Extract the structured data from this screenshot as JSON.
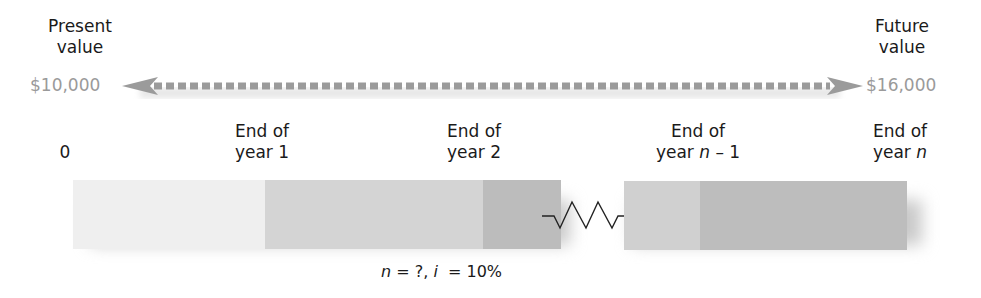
{
  "left": {
    "label_line1": "Present",
    "label_line2": "value",
    "amount": "$10,000"
  },
  "right": {
    "label_line1": "Future",
    "label_line2": "value",
    "amount": "$16,000"
  },
  "ticks": [
    {
      "line1": "",
      "line2": "0"
    },
    {
      "line1": "End of",
      "line2": "year 1"
    },
    {
      "line1": "End of",
      "line2": "year 2"
    },
    {
      "line1": "End of",
      "line2_prefix": "year ",
      "line2_var": "n",
      "line2_suffix": " – 1"
    },
    {
      "line1": "End of",
      "line2_prefix": "year ",
      "line2_var": "n",
      "line2_suffix": ""
    }
  ],
  "formula": {
    "n_var": "n",
    "n_eq": " = ?, ",
    "i_var": "i",
    "i_eq": "  = 10%"
  },
  "colors": {
    "segment_0": "#efefef",
    "segment_1": "#d4d4d4",
    "segment_2": "#bcbcbc",
    "segment_3": "#d0d0d0",
    "segment_4": "#bdbdbd",
    "arrow": "#9b9b9b"
  }
}
